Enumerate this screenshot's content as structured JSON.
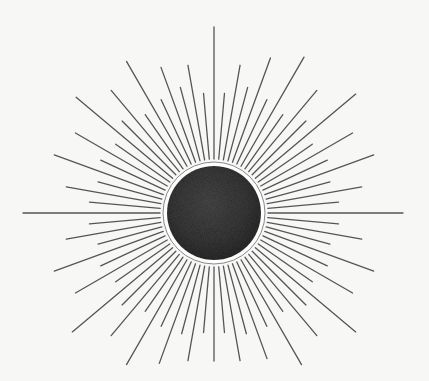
{
  "scene": {
    "subject": "sunburst mirror illustration",
    "background": "#f7f7f6",
    "center": [
      214,
      213
    ],
    "disk_radius": 47,
    "ring_radius": 51,
    "ring_color": "#ffffff",
    "disk_color": "#3a3a3a",
    "ray_color": "#555555",
    "ray_inner_radius": 54
  },
  "rays": [
    {
      "a": -90,
      "l": 186
    },
    {
      "a": -85,
      "l": 120
    },
    {
      "a": -80,
      "l": 150
    },
    {
      "a": -75,
      "l": 130
    },
    {
      "a": -70,
      "l": 165
    },
    {
      "a": -65,
      "l": 125
    },
    {
      "a": -60,
      "l": 180
    },
    {
      "a": -55,
      "l": 120
    },
    {
      "a": -50,
      "l": 160
    },
    {
      "a": -45,
      "l": 130
    },
    {
      "a": -40,
      "l": 185
    },
    {
      "a": -35,
      "l": 120
    },
    {
      "a": -30,
      "l": 160
    },
    {
      "a": -25,
      "l": 125
    },
    {
      "a": -20,
      "l": 170
    },
    {
      "a": -15,
      "l": 120
    },
    {
      "a": -10,
      "l": 150
    },
    {
      "a": -5,
      "l": 125
    },
    {
      "a": 0,
      "l": 189
    },
    {
      "a": 5,
      "l": 125
    },
    {
      "a": 10,
      "l": 150
    },
    {
      "a": 15,
      "l": 120
    },
    {
      "a": 20,
      "l": 170
    },
    {
      "a": 25,
      "l": 125
    },
    {
      "a": 30,
      "l": 160
    },
    {
      "a": 35,
      "l": 120
    },
    {
      "a": 40,
      "l": 185
    },
    {
      "a": 45,
      "l": 130
    },
    {
      "a": 50,
      "l": 160
    },
    {
      "a": 55,
      "l": 120
    },
    {
      "a": 60,
      "l": 175
    },
    {
      "a": 65,
      "l": 125
    },
    {
      "a": 70,
      "l": 155
    },
    {
      "a": 75,
      "l": 125
    },
    {
      "a": 80,
      "l": 150
    },
    {
      "a": 85,
      "l": 120
    },
    {
      "a": 90,
      "l": 148
    },
    {
      "a": 95,
      "l": 120
    },
    {
      "a": 100,
      "l": 150
    },
    {
      "a": 105,
      "l": 125
    },
    {
      "a": 110,
      "l": 160
    },
    {
      "a": 115,
      "l": 125
    },
    {
      "a": 120,
      "l": 175
    },
    {
      "a": 125,
      "l": 120
    },
    {
      "a": 130,
      "l": 160
    },
    {
      "a": 135,
      "l": 130
    },
    {
      "a": 140,
      "l": 185
    },
    {
      "a": 145,
      "l": 120
    },
    {
      "a": 150,
      "l": 160
    },
    {
      "a": 155,
      "l": 125
    },
    {
      "a": 160,
      "l": 170
    },
    {
      "a": 165,
      "l": 120
    },
    {
      "a": 170,
      "l": 150
    },
    {
      "a": 175,
      "l": 125
    },
    {
      "a": 180,
      "l": 191
    },
    {
      "a": 185,
      "l": 125
    },
    {
      "a": 190,
      "l": 150
    },
    {
      "a": 195,
      "l": 120
    },
    {
      "a": 200,
      "l": 170
    },
    {
      "a": 205,
      "l": 125
    },
    {
      "a": 210,
      "l": 160
    },
    {
      "a": 215,
      "l": 120
    },
    {
      "a": 220,
      "l": 180
    },
    {
      "a": 225,
      "l": 130
    },
    {
      "a": 230,
      "l": 160
    },
    {
      "a": 235,
      "l": 120
    },
    {
      "a": 240,
      "l": 175
    },
    {
      "a": 245,
      "l": 125
    },
    {
      "a": 250,
      "l": 155
    },
    {
      "a": 255,
      "l": 130
    },
    {
      "a": 260,
      "l": 150
    },
    {
      "a": 265,
      "l": 120
    }
  ]
}
